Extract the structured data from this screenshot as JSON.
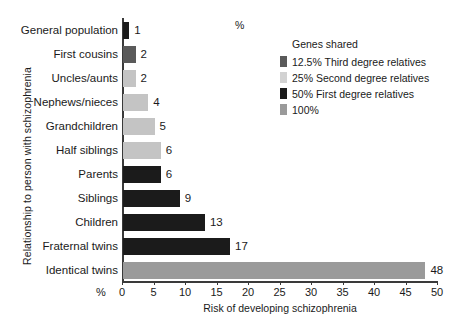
{
  "chart_data": {
    "type": "bar",
    "orientation": "horizontal",
    "title": "",
    "xlabel": "Risk of developing schizophrenia",
    "ylabel": "Relationship to person with schizophrenia",
    "xlim": [
      0,
      50
    ],
    "xticks": [
      0,
      5,
      10,
      15,
      20,
      25,
      30,
      35,
      40,
      45,
      50
    ],
    "unit_label": "%",
    "grid": false,
    "categories": [
      "General population",
      "First cousins",
      "Uncles/aunts",
      "Nephews/nieces",
      "Grandchildren",
      "Half siblings",
      "Parents",
      "Siblings",
      "Children",
      "Fraternal twins",
      "Identical twins"
    ],
    "values": [
      1,
      2,
      2,
      4,
      5,
      6,
      6,
      9,
      13,
      17,
      48
    ],
    "bar_groups": [
      "50% First degree relatives",
      "12.5% Third degree relatives",
      "25% Second degree relatives",
      "25% Second degree relatives",
      "25% Second degree relatives",
      "25% Second degree relatives",
      "50% First degree relatives",
      "50% First degree relatives",
      "50% First degree relatives",
      "50% First degree relatives",
      "100%"
    ],
    "bar_colors": [
      "#1b1b1b",
      "#5a5a5a",
      "#c4c4c4",
      "#c4c4c4",
      "#c4c4c4",
      "#c4c4c4",
      "#1b1b1b",
      "#1b1b1b",
      "#1b1b1b",
      "#1b1b1b",
      "#9a9a9a"
    ]
  },
  "legend": {
    "title": "Genes shared",
    "position": "top-right",
    "items": [
      {
        "label": "12.5% Third degree relatives",
        "color": "#5a5a5a"
      },
      {
        "label": "25% Second degree relatives",
        "color": "#d2d2d2"
      },
      {
        "label": "50% First degree relatives",
        "color": "#1b1b1b"
      },
      {
        "label": "100%",
        "color": "#9a9a9a"
      }
    ]
  }
}
